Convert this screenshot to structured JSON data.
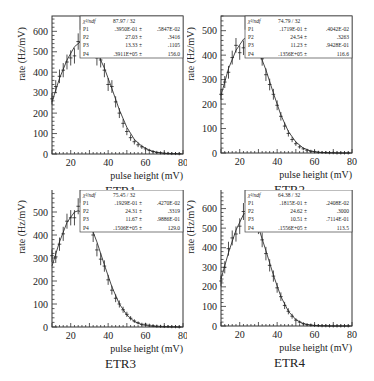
{
  "chart_data": [
    {
      "type": "scatter",
      "title": "ETR1",
      "xlabel": "pulse height (mV)",
      "ylabel": "rate (Hz/mV)",
      "xlim": [
        10,
        80
      ],
      "ylim": [
        0,
        675
      ],
      "xticks": [
        20,
        40,
        60,
        80
      ],
      "yticks": [
        0,
        100,
        200,
        300,
        400,
        500,
        600
      ],
      "grid": false,
      "fit_box": {
        "chi2_label": "χ²/ndf",
        "chi2": "87.97",
        "ndf": "32",
        "params": [
          {
            "name": "P1",
            "value": ".3950E-01",
            "error": ".5847E-02"
          },
          {
            "name": "P2",
            "value": "27.03",
            "error": ".3416"
          },
          {
            "name": "P3",
            "value": "13.33",
            "error": ".1105"
          },
          {
            "name": "P4",
            "value": ".3911E+05",
            "error": "156.0"
          }
        ]
      },
      "series": [
        {
          "name": "data",
          "x": [
            10,
            12,
            14,
            16,
            18,
            20,
            22,
            24,
            26,
            28,
            30,
            32,
            34,
            36,
            38,
            40,
            42,
            44,
            46,
            48,
            50,
            52,
            54,
            56,
            58,
            60,
            62,
            64,
            66,
            68,
            70,
            72,
            74,
            76,
            78
          ],
          "values": [
            270,
            330,
            380,
            410,
            450,
            470,
            480,
            550,
            545,
            540,
            545,
            510,
            470,
            460,
            410,
            340,
            330,
            255,
            200,
            150,
            110,
            80,
            60,
            45,
            35,
            25,
            18,
            12,
            8,
            6,
            4,
            3,
            2,
            2,
            1
          ]
        },
        {
          "name": "fit",
          "x": [
            10,
            14,
            18,
            22,
            26,
            30,
            34,
            38,
            42,
            46,
            50,
            54,
            58,
            62,
            66,
            70,
            74,
            78,
            80
          ],
          "values": [
            255,
            370,
            460,
            525,
            555,
            545,
            500,
            420,
            320,
            215,
            130,
            72,
            38,
            18,
            8,
            3,
            1,
            0.5,
            0.3
          ]
        }
      ]
    },
    {
      "type": "scatter",
      "title": "ETR2",
      "xlabel": "pulse height (mV)",
      "ylabel": "rate (Hz/mV)",
      "xlim": [
        10,
        80
      ],
      "ylim": [
        0,
        560
      ],
      "xticks": [
        20,
        40,
        60,
        80
      ],
      "yticks": [
        0,
        100,
        200,
        300,
        400,
        500
      ],
      "grid": false,
      "fit_box": {
        "chi2_label": "χ²/ndf",
        "chi2": "74.79",
        "ndf": "32",
        "params": [
          {
            "name": "P1",
            "value": ".1719E-01",
            "error": ".4042E-02"
          },
          {
            "name": "P2",
            "value": "24.54",
            "error": ".3263"
          },
          {
            "name": "P3",
            "value": "11.23",
            "error": ".9428E-01"
          },
          {
            "name": "P4",
            "value": ".1356E+05",
            "error": "116.6"
          }
        ]
      },
      "series": [
        {
          "name": "data",
          "x": [
            10,
            12,
            14,
            16,
            18,
            20,
            22,
            24,
            26,
            28,
            30,
            32,
            34,
            36,
            38,
            40,
            42,
            44,
            46,
            48,
            50,
            52,
            54,
            56,
            58,
            60,
            62,
            64,
            66,
            68,
            70,
            72,
            74,
            76,
            78
          ],
          "values": [
            240,
            290,
            330,
            390,
            440,
            410,
            430,
            470,
            490,
            440,
            425,
            385,
            320,
            280,
            240,
            195,
            150,
            110,
            80,
            55,
            38,
            25,
            17,
            11,
            7,
            5,
            3,
            2,
            2,
            1,
            1,
            0,
            0,
            0,
            0
          ]
        },
        {
          "name": "fit",
          "x": [
            10,
            14,
            18,
            22,
            24,
            26,
            30,
            34,
            38,
            42,
            46,
            50,
            54,
            58,
            62,
            66,
            70,
            74,
            78,
            80
          ],
          "values": [
            235,
            345,
            420,
            465,
            472,
            465,
            420,
            340,
            245,
            155,
            88,
            45,
            20,
            8,
            3,
            1,
            0.4,
            0.1,
            0,
            0
          ]
        }
      ]
    },
    {
      "type": "scatter",
      "title": "ETR3",
      "xlabel": "pulse height (mV)",
      "ylabel": "rate (Hz/mV)",
      "xlim": [
        10,
        80
      ],
      "ylim": [
        0,
        600
      ],
      "xticks": [
        20,
        40,
        60,
        80
      ],
      "yticks": [
        0,
        100,
        200,
        300,
        400,
        500
      ],
      "grid": false,
      "fit_box": {
        "chi2_label": "χ²/ndf",
        "chi2": "75.45",
        "ndf": "32",
        "params": [
          {
            "name": "P1",
            "value": ".1929E-01",
            "error": ".4270E-02"
          },
          {
            "name": "P2",
            "value": "24.31",
            "error": ".3319"
          },
          {
            "name": "P3",
            "value": "11.67",
            "error": ".9886E-01"
          },
          {
            "name": "P4",
            "value": ".1506E+05",
            "error": "129.0"
          }
        ]
      },
      "series": [
        {
          "name": "data",
          "x": [
            10,
            12,
            14,
            16,
            18,
            20,
            22,
            24,
            26,
            28,
            30,
            32,
            34,
            36,
            38,
            40,
            42,
            44,
            46,
            48,
            50,
            52,
            54,
            56,
            58,
            60,
            62,
            64,
            66,
            68,
            70,
            72,
            74,
            76,
            78
          ],
          "values": [
            310,
            305,
            360,
            405,
            460,
            475,
            475,
            525,
            510,
            490,
            450,
            400,
            335,
            295,
            265,
            205,
            160,
            125,
            100,
            75,
            55,
            38,
            26,
            18,
            12,
            12,
            8,
            6,
            4,
            3,
            2,
            2,
            1,
            1,
            0
          ]
        },
        {
          "name": "fit",
          "x": [
            10,
            14,
            18,
            22,
            24,
            26,
            30,
            34,
            38,
            42,
            46,
            50,
            54,
            58,
            62,
            66,
            70,
            74,
            78,
            80
          ],
          "values": [
            265,
            370,
            455,
            500,
            505,
            500,
            455,
            370,
            270,
            175,
            100,
            52,
            24,
            10,
            4,
            1.5,
            0.5,
            0.2,
            0,
            0
          ]
        }
      ]
    },
    {
      "type": "scatter",
      "title": "ETR4",
      "xlabel": "pulse height (mV)",
      "ylabel": "rate (Hz/mV)",
      "xlim": [
        10,
        80
      ],
      "ylim": [
        0,
        700
      ],
      "xticks": [
        20,
        40,
        60,
        80
      ],
      "yticks": [
        0,
        100,
        200,
        300,
        400,
        500,
        600
      ],
      "grid": false,
      "fit_box": {
        "chi2_label": "χ²/ndf",
        "chi2": "64.38",
        "ndf": "32",
        "params": [
          {
            "name": "P1",
            "value": ".1815E-01",
            "error": ".2408E-02"
          },
          {
            "name": "P2",
            "value": "24.62",
            "error": ".3000"
          },
          {
            "name": "P3",
            "value": "10.51",
            "error": ".7114E-01"
          },
          {
            "name": "P4",
            "value": ".1556E+05",
            "error": "113.5"
          }
        ]
      },
      "series": [
        {
          "name": "data",
          "x": [
            10,
            12,
            14,
            16,
            18,
            20,
            22,
            24,
            26,
            28,
            30,
            32,
            34,
            36,
            38,
            40,
            42,
            44,
            46,
            48,
            50,
            52,
            54,
            56,
            58,
            60,
            62,
            64,
            66,
            68,
            70,
            72,
            74,
            76,
            78
          ],
          "values": [
            230,
            300,
            395,
            450,
            470,
            510,
            585,
            615,
            575,
            565,
            510,
            440,
            370,
            310,
            255,
            195,
            150,
            105,
            75,
            50,
            30,
            20,
            12,
            7,
            5,
            3,
            2,
            1,
            1,
            0,
            0,
            0,
            0,
            0,
            0
          ]
        },
        {
          "name": "fit",
          "x": [
            10,
            14,
            18,
            22,
            24,
            26,
            30,
            34,
            38,
            42,
            46,
            50,
            54,
            58,
            62,
            66,
            70,
            74,
            78,
            80
          ],
          "values": [
            240,
            375,
            490,
            570,
            582,
            572,
            505,
            385,
            260,
            150,
            75,
            32,
            12,
            4,
            1,
            0.3,
            0,
            0,
            0,
            0
          ]
        }
      ]
    }
  ]
}
